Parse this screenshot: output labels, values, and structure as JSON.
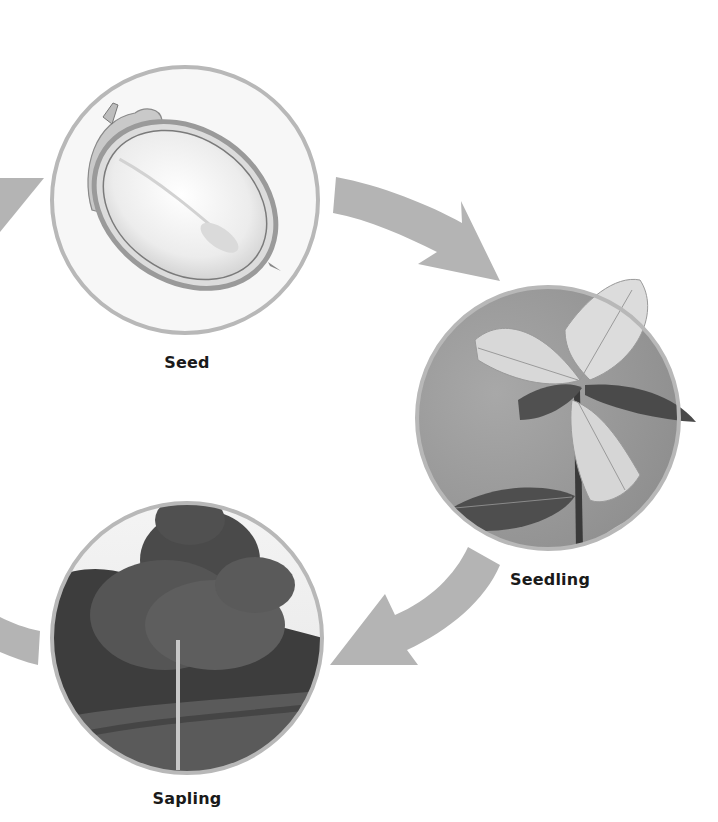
{
  "diagram": {
    "type": "life-cycle",
    "stages": [
      {
        "id": "seed",
        "label": "Seed",
        "image": "acorn-cross-section-illustration"
      },
      {
        "id": "seedling",
        "label": "Seedling",
        "image": "oak-seedling-photo"
      },
      {
        "id": "sapling",
        "label": "Sapling",
        "image": "young-oak-tree-photo"
      }
    ],
    "arrows": [
      {
        "from": "previous-stage",
        "to": "seed",
        "direction": "up-right",
        "partial": true
      },
      {
        "from": "seed",
        "to": "seedling",
        "direction": "down-right"
      },
      {
        "from": "seedling",
        "to": "sapling",
        "direction": "down-left"
      },
      {
        "from": "sapling",
        "to": "next-stage",
        "direction": "left",
        "partial": true
      }
    ],
    "colors": {
      "arrow": "#b4b4b4",
      "circle_border": "#b8b8b8",
      "label_text": "#1a1a1a",
      "background": "#ffffff"
    }
  }
}
